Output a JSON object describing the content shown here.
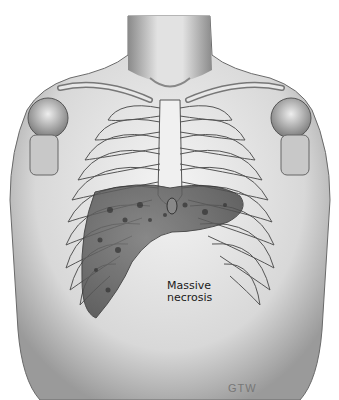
{
  "illustration": {
    "subject": "Anterior torso with rib cage and liver",
    "annotation": {
      "line1": "Massive",
      "line2": "necrosis"
    },
    "signature": "GTW",
    "colors": {
      "skin_light": "#e6e6e6",
      "skin_shadow": "#9a9a9a",
      "rib_outline": "#555555",
      "liver": "#5e5e5e",
      "liver_spots": "#3a3a3a",
      "background": "#ffffff"
    }
  }
}
